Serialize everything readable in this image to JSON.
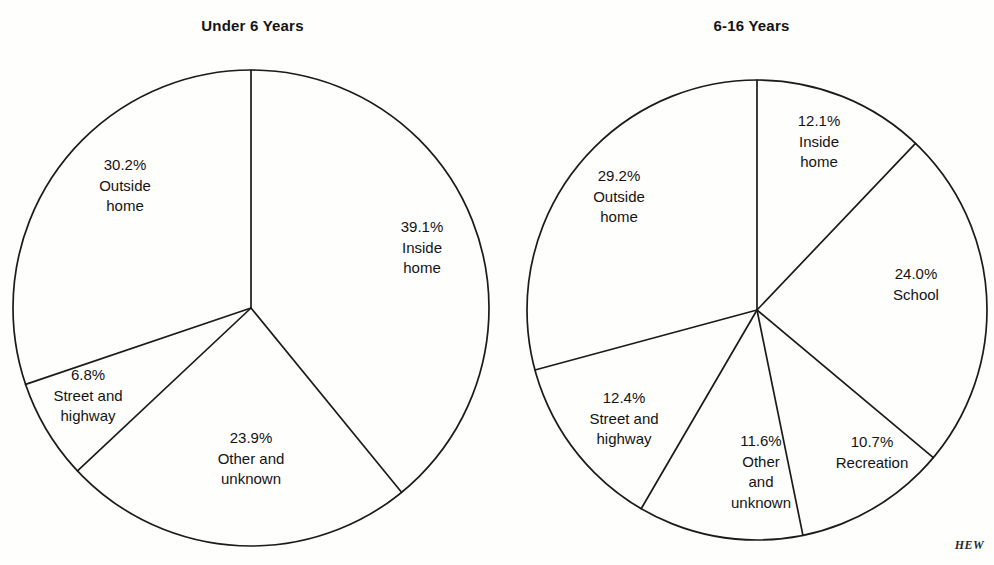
{
  "credit": "HEW",
  "chart_data": [
    {
      "type": "pie",
      "title": "Under 6 Years",
      "unit": "percent",
      "start_angle_deg": 0,
      "direction": "clockwise",
      "center": [
        251,
        308
      ],
      "radius": 238,
      "categories": [
        "Inside home",
        "Other and unknown",
        "Street and highway",
        "Outside home"
      ],
      "values": [
        39.1,
        23.9,
        6.8,
        30.2
      ],
      "slices": [
        {
          "pct": "39.1%",
          "name": "Inside\nhome",
          "name_lines": [
            "Inside",
            "home"
          ],
          "value": 39.1,
          "label_x": 422,
          "label_y": 248
        },
        {
          "pct": "23.9%",
          "name": "Other and\nunknown",
          "name_lines": [
            "Other and",
            "unknown"
          ],
          "value": 23.9,
          "label_x": 251,
          "label_y": 459
        },
        {
          "pct": "6.8%",
          "name": "Street and\nhighway",
          "name_lines": [
            "Street and",
            "highway"
          ],
          "value": 6.8,
          "label_x": 88,
          "label_y": 396
        },
        {
          "pct": "30.2%",
          "name": "Outside\nhome",
          "name_lines": [
            "Outside",
            "home"
          ],
          "value": 30.2,
          "label_x": 125,
          "label_y": 186
        }
      ]
    },
    {
      "type": "pie",
      "title": "6-16 Years",
      "unit": "percent",
      "start_angle_deg": 0,
      "direction": "clockwise",
      "center": [
        757,
        310
      ],
      "radius": 230,
      "categories": [
        "Inside home",
        "School",
        "Recreation",
        "Other and unknown",
        "Street and highway",
        "Outside home"
      ],
      "values": [
        12.1,
        24.0,
        10.7,
        11.6,
        12.4,
        29.2
      ],
      "slices": [
        {
          "pct": "12.1%",
          "name": "Inside\nhome",
          "name_lines": [
            "Inside",
            "home"
          ],
          "value": 12.1,
          "label_x": 819,
          "label_y": 142
        },
        {
          "pct": "24.0%",
          "name": "School",
          "name_lines": [
            "School"
          ],
          "value": 24.0,
          "label_x": 916,
          "label_y": 284
        },
        {
          "pct": "10.7%",
          "name": "Recreation",
          "name_lines": [
            "Recreation"
          ],
          "value": 10.7,
          "label_x": 872,
          "label_y": 452
        },
        {
          "pct": "11.6%",
          "name": "Other\nand\nunknown",
          "name_lines": [
            "Other",
            "and",
            "unknown"
          ],
          "value": 11.6,
          "label_x": 761,
          "label_y": 472
        },
        {
          "pct": "12.4%",
          "name": "Street and\nhighway",
          "name_lines": [
            "Street and",
            "highway"
          ],
          "value": 12.4,
          "label_x": 624,
          "label_y": 419
        },
        {
          "pct": "29.2%",
          "name": "Outside\nhome",
          "name_lines": [
            "Outside",
            "home"
          ],
          "value": 29.2,
          "label_x": 619,
          "label_y": 197
        }
      ]
    }
  ]
}
